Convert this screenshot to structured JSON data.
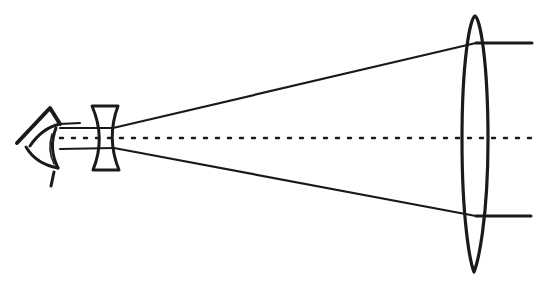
{
  "diagram": {
    "title": "Galilean telescope optical path",
    "colors": {
      "background": "#ffffff",
      "ink": "#1a1a1a"
    },
    "elements": {
      "eye": {
        "label": "eye"
      },
      "eyepiece": {
        "label": "concave lens"
      },
      "objective": {
        "label": "convex lens"
      },
      "axis": {
        "label": "optical axis"
      },
      "upper_ray": {
        "label": "upper ray"
      },
      "lower_ray": {
        "label": "lower ray"
      }
    }
  }
}
